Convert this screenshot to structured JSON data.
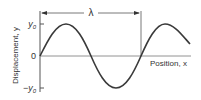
{
  "diagram": {
    "type": "sine-wave",
    "y_axis_label": "Displacement, y",
    "x_axis_label": "Position, x",
    "ticks": {
      "top": "y0",
      "zero": "0",
      "bottom": "-y0"
    },
    "wavelength_label": "λ",
    "colors": {
      "line": "#3a3a3a",
      "axis": "#555555",
      "text": "#333333"
    }
  }
}
